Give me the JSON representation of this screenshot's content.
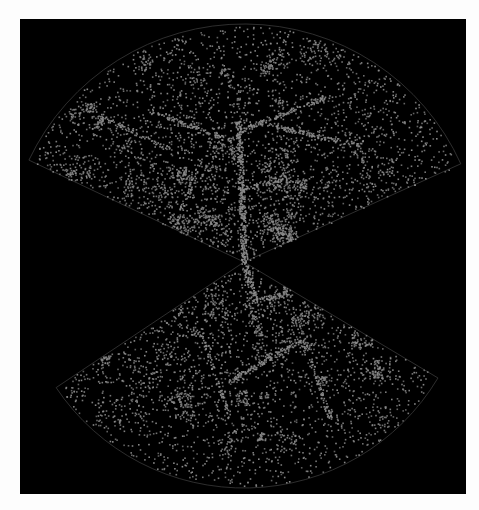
{
  "figure": {
    "type": "galaxy redshift survey cone diagram",
    "background_color": "#000000",
    "page_color": "#fdfdfd",
    "point_color": "#8c8c8c",
    "outline_color": "#3a3a3a",
    "apex": [
      244,
      262
    ],
    "wedges": [
      {
        "name": "north-slice",
        "left_tip": [
          35,
          163
        ],
        "right_tip": [
          456,
          166
        ],
        "outer_arc_top": 24,
        "inner_arc_top": 67
      },
      {
        "name": "south-slice",
        "left_tip": [
          57,
          387
        ],
        "right_tip": [
          438,
          378
        ],
        "outer_arc_bottom": 488,
        "inner_arc_bottom": 455
      }
    ],
    "filaments": [
      {
        "wedge": 0,
        "from": [
          244,
          262
        ],
        "to": [
          238,
          120
        ],
        "weight": 1.0
      },
      {
        "wedge": 0,
        "from": [
          238,
          190
        ],
        "to": [
          290,
          175
        ],
        "weight": 0.6
      },
      {
        "wedge": 0,
        "from": [
          230,
          140
        ],
        "to": [
          150,
          110
        ],
        "weight": 0.5
      },
      {
        "wedge": 0,
        "from": [
          240,
          130
        ],
        "to": [
          330,
          95
        ],
        "weight": 0.6
      },
      {
        "wedge": 0,
        "from": [
          270,
          125
        ],
        "to": [
          360,
          145
        ],
        "weight": 0.5
      },
      {
        "wedge": 0,
        "from": [
          100,
          115
        ],
        "to": [
          170,
          150
        ],
        "weight": 0.4
      },
      {
        "wedge": 0,
        "from": [
          200,
          160
        ],
        "to": [
          180,
          210
        ],
        "weight": 0.4
      },
      {
        "wedge": 1,
        "from": [
          244,
          262
        ],
        "to": [
          255,
          300
        ],
        "weight": 0.9
      },
      {
        "wedge": 1,
        "from": [
          255,
          300
        ],
        "to": [
          300,
          290
        ],
        "weight": 0.5
      },
      {
        "wedge": 1,
        "from": [
          230,
          380
        ],
        "to": [
          300,
          340
        ],
        "weight": 0.7
      },
      {
        "wedge": 1,
        "from": [
          310,
          360
        ],
        "to": [
          330,
          420
        ],
        "weight": 0.5
      },
      {
        "wedge": 1,
        "from": [
          200,
          330
        ],
        "to": [
          230,
          420
        ],
        "weight": 0.4
      }
    ]
  }
}
